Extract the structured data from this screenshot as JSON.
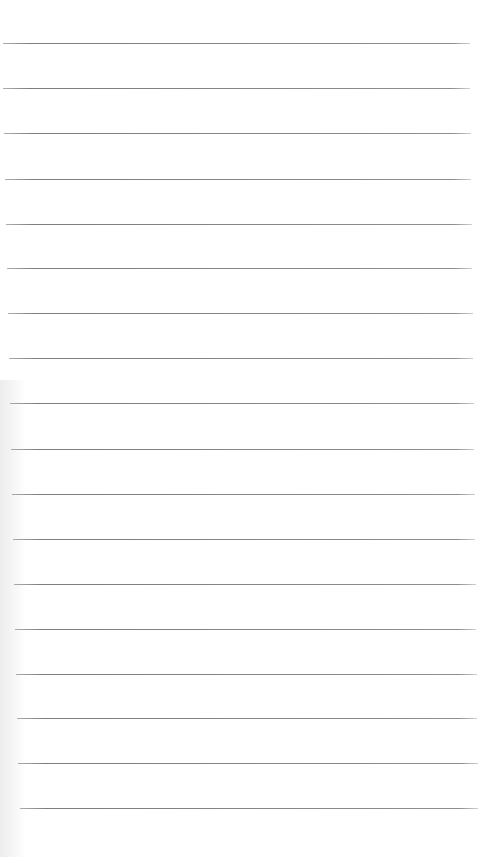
{
  "page": {
    "type": "lined-notebook-paper",
    "background_color": "#ffffff",
    "line_color": "#858585",
    "line_count": 18,
    "lines": [
      {
        "y": 43,
        "x1": 3,
        "x2": 470
      },
      {
        "y": 88,
        "x1": 3,
        "x2": 470
      },
      {
        "y": 133,
        "x1": 4,
        "x2": 471
      },
      {
        "y": 179,
        "x1": 5,
        "x2": 471
      },
      {
        "y": 224,
        "x1": 6,
        "x2": 472
      },
      {
        "y": 268,
        "x1": 7,
        "x2": 472
      },
      {
        "y": 313,
        "x1": 8,
        "x2": 473
      },
      {
        "y": 358,
        "x1": 9,
        "x2": 473
      },
      {
        "y": 403,
        "x1": 10,
        "x2": 474
      },
      {
        "y": 449,
        "x1": 11,
        "x2": 474
      },
      {
        "y": 494,
        "x1": 12,
        "x2": 475
      },
      {
        "y": 539,
        "x1": 13,
        "x2": 475
      },
      {
        "y": 584,
        "x1": 14,
        "x2": 476
      },
      {
        "y": 629,
        "x1": 15,
        "x2": 476
      },
      {
        "y": 674,
        "x1": 16,
        "x2": 477
      },
      {
        "y": 718,
        "x1": 17,
        "x2": 477
      },
      {
        "y": 763,
        "x1": 18,
        "x2": 478
      },
      {
        "y": 808,
        "x1": 20,
        "x2": 478
      }
    ]
  }
}
